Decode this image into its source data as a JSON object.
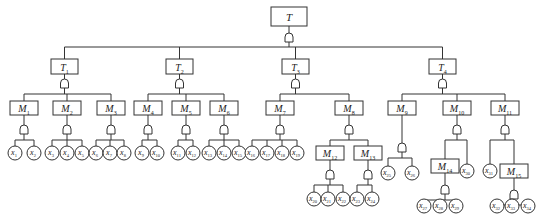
{
  "diagram": {
    "type": "fault-tree",
    "gate_type": "AND",
    "top_event": {
      "id": "T",
      "label": "T",
      "x": 271,
      "y": 7,
      "w": 36,
      "h": 19,
      "gate_y": 33
    },
    "level1_bus_y": 47,
    "events": [
      {
        "id": "T1",
        "label": "T",
        "sub": "1",
        "x": 51,
        "y": 59,
        "w": 27,
        "h": 15,
        "gate_y": 79
      },
      {
        "id": "T2",
        "label": "T",
        "sub": "2",
        "x": 166,
        "y": 59,
        "w": 27,
        "h": 15,
        "gate_y": 79
      },
      {
        "id": "T3",
        "label": "T",
        "sub": "3",
        "x": 282,
        "y": 59,
        "w": 27,
        "h": 15,
        "gate_y": 79
      },
      {
        "id": "T4",
        "label": "T",
        "sub": "4",
        "x": 429,
        "y": 59,
        "w": 27,
        "h": 15,
        "gate_y": 79
      },
      {
        "id": "M1",
        "label": "M",
        "sub": "1",
        "x": 10,
        "y": 101,
        "w": 28,
        "h": 14,
        "gate_y": 125
      },
      {
        "id": "M2",
        "label": "M",
        "sub": "2",
        "x": 53,
        "y": 101,
        "w": 28,
        "h": 14,
        "gate_y": 125
      },
      {
        "id": "M3",
        "label": "M",
        "sub": "3",
        "x": 97,
        "y": 101,
        "w": 28,
        "h": 14,
        "gate_y": 125
      },
      {
        "id": "M4",
        "label": "M",
        "sub": "4",
        "x": 134,
        "y": 101,
        "w": 28,
        "h": 14,
        "gate_y": 125
      },
      {
        "id": "M5",
        "label": "M",
        "sub": "5",
        "x": 172,
        "y": 101,
        "w": 28,
        "h": 14,
        "gate_y": 125
      },
      {
        "id": "M6",
        "label": "M",
        "sub": "6",
        "x": 210,
        "y": 101,
        "w": 28,
        "h": 14,
        "gate_y": 125
      },
      {
        "id": "M7",
        "label": "M",
        "sub": "7",
        "x": 266,
        "y": 101,
        "w": 28,
        "h": 14,
        "gate_y": 125
      },
      {
        "id": "M8",
        "label": "M",
        "sub": "8",
        "x": 335,
        "y": 101,
        "w": 28,
        "h": 14,
        "gate_y": 125
      },
      {
        "id": "M9",
        "label": "M",
        "sub": "9",
        "x": 388,
        "y": 101,
        "w": 28,
        "h": 14,
        "gate_y": 143
      },
      {
        "id": "M10",
        "label": "M",
        "sub": "10",
        "x": 443,
        "y": 101,
        "w": 28,
        "h": 14,
        "gate_y": 125
      },
      {
        "id": "M11",
        "label": "M",
        "sub": "11",
        "x": 491,
        "y": 101,
        "w": 28,
        "h": 14,
        "gate_y": 125
      },
      {
        "id": "M12",
        "label": "M",
        "sub": "12",
        "x": 316,
        "y": 146,
        "w": 28,
        "h": 14,
        "gate_y": 170
      },
      {
        "id": "M13",
        "label": "M",
        "sub": "13",
        "x": 354,
        "y": 146,
        "w": 28,
        "h": 14,
        "gate_y": 170
      },
      {
        "id": "M14",
        "label": "M",
        "sub": "14",
        "x": 431,
        "y": 159,
        "w": 28,
        "h": 14,
        "gate_y": 185
      },
      {
        "id": "M15",
        "label": "M",
        "sub": "15",
        "x": 500,
        "y": 164,
        "w": 28,
        "h": 14,
        "gate_y": 190
      }
    ],
    "basic_events": [
      {
        "id": "x1",
        "label": "x",
        "sub": "1",
        "cx": 15,
        "cy": 153
      },
      {
        "id": "x2",
        "label": "x",
        "sub": "2",
        "cx": 34,
        "cy": 153
      },
      {
        "id": "x3",
        "label": "x",
        "sub": "3",
        "cx": 52,
        "cy": 153
      },
      {
        "id": "x4",
        "label": "x",
        "sub": "4",
        "cx": 67,
        "cy": 153
      },
      {
        "id": "x5",
        "label": "x",
        "sub": "5",
        "cx": 82,
        "cy": 153
      },
      {
        "id": "x6",
        "label": "x",
        "sub": "6",
        "cx": 96,
        "cy": 153
      },
      {
        "id": "x7",
        "label": "x",
        "sub": "7",
        "cx": 110,
        "cy": 153
      },
      {
        "id": "x8",
        "label": "x",
        "sub": "8",
        "cx": 124,
        "cy": 153
      },
      {
        "id": "x9",
        "label": "x",
        "sub": "9",
        "cx": 142,
        "cy": 153
      },
      {
        "id": "x10",
        "label": "x",
        "sub": "10",
        "cx": 157,
        "cy": 153
      },
      {
        "id": "x11",
        "label": "x",
        "sub": "11",
        "cx": 178,
        "cy": 153
      },
      {
        "id": "x12",
        "label": "x",
        "sub": "12",
        "cx": 193,
        "cy": 153
      },
      {
        "id": "x13",
        "label": "x",
        "sub": "13",
        "cx": 209,
        "cy": 153
      },
      {
        "id": "x14",
        "label": "x",
        "sub": "14",
        "cx": 224,
        "cy": 153
      },
      {
        "id": "x15",
        "label": "x",
        "sub": "15",
        "cx": 239,
        "cy": 153
      },
      {
        "id": "x16",
        "label": "x",
        "sub": "16",
        "cx": 252,
        "cy": 153
      },
      {
        "id": "x17",
        "label": "x",
        "sub": "17",
        "cx": 267,
        "cy": 153
      },
      {
        "id": "x18",
        "label": "x",
        "sub": "18",
        "cx": 282,
        "cy": 153
      },
      {
        "id": "x19",
        "label": "x",
        "sub": "19",
        "cx": 297,
        "cy": 153
      },
      {
        "id": "x20",
        "label": "x",
        "sub": "20",
        "cx": 314,
        "cy": 199
      },
      {
        "id": "x21",
        "label": "x",
        "sub": "21",
        "cx": 328,
        "cy": 199
      },
      {
        "id": "x22",
        "label": "x",
        "sub": "22",
        "cx": 343,
        "cy": 199
      },
      {
        "id": "x23",
        "label": "x",
        "sub": "23",
        "cx": 357,
        "cy": 199
      },
      {
        "id": "x24",
        "label": "x",
        "sub": "24",
        "cx": 372,
        "cy": 199
      },
      {
        "id": "x25",
        "label": "x",
        "sub": "25",
        "cx": 388,
        "cy": 173
      },
      {
        "id": "x26",
        "label": "x",
        "sub": "26",
        "cx": 412,
        "cy": 173
      },
      {
        "id": "x27",
        "label": "x",
        "sub": "27",
        "cx": 424,
        "cy": 206
      },
      {
        "id": "x28",
        "label": "x",
        "sub": "28",
        "cx": 440,
        "cy": 206
      },
      {
        "id": "x29",
        "label": "x",
        "sub": "29",
        "cx": 456,
        "cy": 206
      },
      {
        "id": "x30",
        "label": "x",
        "sub": "30",
        "cx": 467,
        "cy": 171
      },
      {
        "id": "x31",
        "label": "x",
        "sub": "31",
        "cx": 490,
        "cy": 171
      },
      {
        "id": "x32",
        "label": "x",
        "sub": "32",
        "cx": 497,
        "cy": 206
      },
      {
        "id": "x33",
        "label": "x",
        "sub": "33",
        "cx": 512,
        "cy": 206
      },
      {
        "id": "x34",
        "label": "x",
        "sub": "34",
        "cx": 528,
        "cy": 206
      }
    ],
    "edges": [
      {
        "parent": "T",
        "children": [
          "T1",
          "T2",
          "T3",
          "T4"
        ]
      },
      {
        "parent": "T1",
        "children": [
          "M1",
          "M2",
          "M3"
        ]
      },
      {
        "parent": "T2",
        "children": [
          "M4",
          "M5",
          "M6"
        ]
      },
      {
        "parent": "T3",
        "children": [
          "M7",
          "M8"
        ]
      },
      {
        "parent": "T4",
        "children": [
          "M9",
          "M10",
          "M11"
        ]
      },
      {
        "parent": "M1",
        "children": [
          "x1",
          "x2"
        ]
      },
      {
        "parent": "M2",
        "children": [
          "x3",
          "x4",
          "x5"
        ]
      },
      {
        "parent": "M3",
        "children": [
          "x6",
          "x7",
          "x8"
        ]
      },
      {
        "parent": "M4",
        "children": [
          "x9",
          "x10"
        ]
      },
      {
        "parent": "M5",
        "children": [
          "x11",
          "x12"
        ]
      },
      {
        "parent": "M6",
        "children": [
          "x13",
          "x14",
          "x15"
        ]
      },
      {
        "parent": "M7",
        "children": [
          "x16",
          "x17",
          "x18",
          "x19"
        ]
      },
      {
        "parent": "M8",
        "children": [
          "M12",
          "M13"
        ]
      },
      {
        "parent": "M12",
        "children": [
          "x20",
          "x21",
          "x22"
        ]
      },
      {
        "parent": "M13",
        "children": [
          "x23",
          "x24"
        ]
      },
      {
        "parent": "M9",
        "children": [
          "x25",
          "x26"
        ]
      },
      {
        "parent": "M10",
        "children": [
          "M14",
          "x30"
        ]
      },
      {
        "parent": "M14",
        "children": [
          "x27",
          "x28",
          "x29"
        ]
      },
      {
        "parent": "M11",
        "children": [
          "x31",
          "M15"
        ]
      },
      {
        "parent": "M15",
        "children": [
          "x32",
          "x33",
          "x34"
        ]
      }
    ]
  }
}
